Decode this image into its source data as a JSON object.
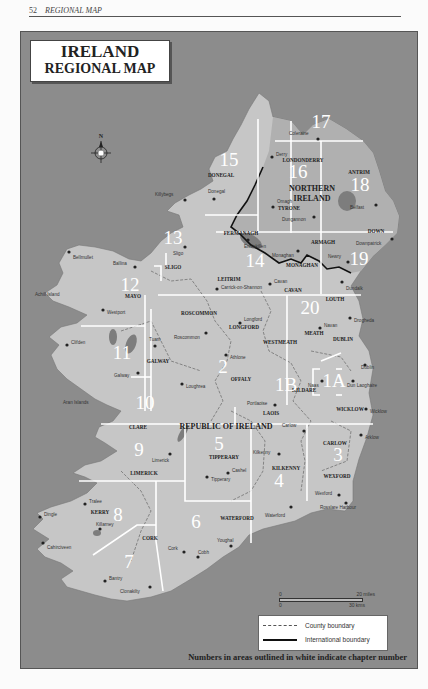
{
  "page_header": {
    "page_number": "52",
    "section": "REGIONAL MAP"
  },
  "map": {
    "title_line1": "IRELAND",
    "title_line2": "REGIONAL MAP",
    "compass_label": "N",
    "regions": [
      {
        "chapter": "1A",
        "x": 333,
        "y": 386
      },
      {
        "chapter": "1B",
        "x": 285,
        "y": 390
      },
      {
        "chapter": "2",
        "x": 222,
        "y": 372
      },
      {
        "chapter": "3",
        "x": 337,
        "y": 460
      },
      {
        "chapter": "4",
        "x": 278,
        "y": 486
      },
      {
        "chapter": "5",
        "x": 218,
        "y": 449
      },
      {
        "chapter": "6",
        "x": 195,
        "y": 527
      },
      {
        "chapter": "7",
        "x": 128,
        "y": 567
      },
      {
        "chapter": "8",
        "x": 117,
        "y": 520
      },
      {
        "chapter": "9",
        "x": 138,
        "y": 455
      },
      {
        "chapter": "10",
        "x": 144,
        "y": 408
      },
      {
        "chapter": "11",
        "x": 121,
        "y": 358
      },
      {
        "chapter": "12",
        "x": 129,
        "y": 290
      },
      {
        "chapter": "13",
        "x": 172,
        "y": 243
      },
      {
        "chapter": "14",
        "x": 254,
        "y": 266
      },
      {
        "chapter": "15",
        "x": 228,
        "y": 165
      },
      {
        "chapter": "16",
        "x": 297,
        "y": 177
      },
      {
        "chapter": "17",
        "x": 320,
        "y": 127
      },
      {
        "chapter": "18",
        "x": 359,
        "y": 190
      },
      {
        "chapter": "19",
        "x": 358,
        "y": 264
      },
      {
        "chapter": "20",
        "x": 309,
        "y": 313
      }
    ],
    "counties": [
      {
        "name": "DONEGAL",
        "x": 220,
        "y": 176
      },
      {
        "name": "LONDONDERRY",
        "x": 302,
        "y": 161
      },
      {
        "name": "ANTRIM",
        "x": 358,
        "y": 173
      },
      {
        "name": "TYRONE",
        "x": 288,
        "y": 209
      },
      {
        "name": "FERMANAGH",
        "x": 240,
        "y": 234
      },
      {
        "name": "ARMAGH",
        "x": 322,
        "y": 243
      },
      {
        "name": "DOWN",
        "x": 375,
        "y": 232
      },
      {
        "name": "MONAGHAN",
        "x": 301,
        "y": 266
      },
      {
        "name": "SLIGO",
        "x": 172,
        "y": 268
      },
      {
        "name": "LEITRIM",
        "x": 228,
        "y": 280
      },
      {
        "name": "CAVAN",
        "x": 292,
        "y": 291
      },
      {
        "name": "MAYO",
        "x": 132,
        "y": 297
      },
      {
        "name": "ROSCOMMON",
        "x": 198,
        "y": 314
      },
      {
        "name": "LOUTH",
        "x": 334,
        "y": 300
      },
      {
        "name": "LONGFORD",
        "x": 243,
        "y": 328
      },
      {
        "name": "MEATH",
        "x": 313,
        "y": 334
      },
      {
        "name": "WESTMEATH",
        "x": 279,
        "y": 343
      },
      {
        "name": "DUBLIN",
        "x": 342,
        "y": 340
      },
      {
        "name": "GALWAY",
        "x": 157,
        "y": 362
      },
      {
        "name": "OFFALY",
        "x": 240,
        "y": 380
      },
      {
        "name": "KILDARE",
        "x": 303,
        "y": 391
      },
      {
        "name": "LAOIS",
        "x": 270,
        "y": 414
      },
      {
        "name": "WICKLOW",
        "x": 349,
        "y": 410
      },
      {
        "name": "CLARE",
        "x": 137,
        "y": 428
      },
      {
        "name": "CARLOW",
        "x": 334,
        "y": 444
      },
      {
        "name": "TIPPERARY",
        "x": 223,
        "y": 458
      },
      {
        "name": "KILKENNY",
        "x": 285,
        "y": 469
      },
      {
        "name": "WEXFORD",
        "x": 336,
        "y": 477
      },
      {
        "name": "LIMERICK",
        "x": 143,
        "y": 474
      },
      {
        "name": "KERRY",
        "x": 99,
        "y": 513
      },
      {
        "name": "CORK",
        "x": 149,
        "y": 539
      },
      {
        "name": "WATERFORD",
        "x": 236,
        "y": 519
      }
    ],
    "country_labels": [
      {
        "name": "NORTHERN",
        "x": 311,
        "y": 190
      },
      {
        "name": "IRELAND",
        "x": 311,
        "y": 200
      },
      {
        "name": "REPUBLIC OF IRELAND",
        "x": 225,
        "y": 428
      }
    ],
    "towns": [
      {
        "name": "Coleraine",
        "x": 317,
        "y": 138,
        "dx": -29,
        "dy": -6
      },
      {
        "name": "Derry",
        "x": 271,
        "y": 156,
        "dx": 4,
        "dy": -3
      },
      {
        "name": "Killybegs",
        "x": 184,
        "y": 199,
        "dx": -30,
        "dy": -6
      },
      {
        "name": "Donegal",
        "x": 213,
        "y": 198,
        "dx": -6,
        "dy": -8
      },
      {
        "name": "Omagh",
        "x": 272,
        "y": 206,
        "dx": 4,
        "dy": -6
      },
      {
        "name": "Dungannon",
        "x": 313,
        "y": 216,
        "dx": -32,
        "dy": 2
      },
      {
        "name": "Belfast",
        "x": 375,
        "y": 204,
        "dx": -26,
        "dy": 2
      },
      {
        "name": "Enniskillen",
        "x": 247,
        "y": 239,
        "dx": -4,
        "dy": 6
      },
      {
        "name": "Downpatrick",
        "x": 391,
        "y": 238,
        "dx": -36,
        "dy": 4
      },
      {
        "name": "Monaghan",
        "x": 297,
        "y": 250,
        "dx": -26,
        "dy": 4
      },
      {
        "name": "Newry",
        "x": 347,
        "y": 261,
        "dx": -20,
        "dy": -6
      },
      {
        "name": "Sligo",
        "x": 184,
        "y": 246,
        "dx": -12,
        "dy": 6
      },
      {
        "name": "Bellmullet",
        "x": 68,
        "y": 251,
        "dx": 4,
        "dy": 5
      },
      {
        "name": "Ballina",
        "x": 134,
        "y": 266,
        "dx": -22,
        "dy": -4
      },
      {
        "name": "Carrick-on-Shannon",
        "x": 216,
        "y": 288,
        "dx": 4,
        "dy": -2
      },
      {
        "name": "Cavan",
        "x": 269,
        "y": 283,
        "dx": 4,
        "dy": -3
      },
      {
        "name": "Dundalk",
        "x": 341,
        "y": 281,
        "dx": 4,
        "dy": 6
      },
      {
        "name": "Westport",
        "x": 102,
        "y": 309,
        "dx": 4,
        "dy": 2
      },
      {
        "name": "Achill Island",
        "x": 34,
        "y": 293,
        "dx": 0,
        "dy": 0
      },
      {
        "name": "Longford",
        "x": 239,
        "y": 322,
        "dx": 4,
        "dy": -4
      },
      {
        "name": "Roscommon",
        "x": 205,
        "y": 332,
        "dx": -32,
        "dy": 4
      },
      {
        "name": "Drogheda",
        "x": 349,
        "y": 317,
        "dx": 4,
        "dy": 2
      },
      {
        "name": "Navan",
        "x": 319,
        "y": 327,
        "dx": 4,
        "dy": -3
      },
      {
        "name": "Clifden",
        "x": 66,
        "y": 344,
        "dx": 4,
        "dy": -3
      },
      {
        "name": "Tuam",
        "x": 154,
        "y": 345,
        "dx": -6,
        "dy": -7
      },
      {
        "name": "Athlone",
        "x": 225,
        "y": 354,
        "dx": 4,
        "dy": 2
      },
      {
        "name": "Galway",
        "x": 137,
        "y": 372,
        "dx": -24,
        "dy": 2
      },
      {
        "name": "Loughrea",
        "x": 181,
        "y": 383,
        "dx": 4,
        "dy": 2
      },
      {
        "name": "Dublin",
        "x": 364,
        "y": 364,
        "dx": -4,
        "dy": 2
      },
      {
        "name": "Naas",
        "x": 321,
        "y": 380,
        "dx": -14,
        "dy": 4
      },
      {
        "name": "Dun Laoghaire",
        "x": 352,
        "y": 380,
        "dx": -6,
        "dy": 4
      },
      {
        "name": "Aran Islands",
        "x": 62,
        "y": 401,
        "dx": 0,
        "dy": 0
      },
      {
        "name": "Portlaoise",
        "x": 274,
        "y": 404,
        "dx": -28,
        "dy": -2
      },
      {
        "name": "Wicklow",
        "x": 365,
        "y": 408,
        "dx": 4,
        "dy": 2
      },
      {
        "name": "Carlow",
        "x": 303,
        "y": 430,
        "dx": -22,
        "dy": -6
      },
      {
        "name": "Arklow",
        "x": 360,
        "y": 434,
        "dx": 4,
        "dy": 2
      },
      {
        "name": "Limerick",
        "x": 169,
        "y": 453,
        "dx": -18,
        "dy": 6
      },
      {
        "name": "Kilkenny",
        "x": 278,
        "y": 453,
        "dx": -26,
        "dy": -2
      },
      {
        "name": "Cashel",
        "x": 227,
        "y": 472,
        "dx": 4,
        "dy": -3
      },
      {
        "name": "Tipperary",
        "x": 206,
        "y": 476,
        "dx": 4,
        "dy": 2
      },
      {
        "name": "Wexford",
        "x": 338,
        "y": 494,
        "dx": -24,
        "dy": -2
      },
      {
        "name": "Rosslare Harbour",
        "x": 345,
        "y": 502,
        "dx": -26,
        "dy": 4
      },
      {
        "name": "Tralee",
        "x": 84,
        "y": 503,
        "dx": 4,
        "dy": -3
      },
      {
        "name": "Dingle",
        "x": 39,
        "y": 516,
        "dx": 4,
        "dy": -3
      },
      {
        "name": "Killarney",
        "x": 99,
        "y": 528,
        "dx": -4,
        "dy": -5
      },
      {
        "name": "Waterford",
        "x": 290,
        "y": 506,
        "dx": -26,
        "dy": 8
      },
      {
        "name": "Cahirciveen",
        "x": 42,
        "y": 542,
        "dx": 4,
        "dy": 4
      },
      {
        "name": "Youghal",
        "x": 230,
        "y": 545,
        "dx": -14,
        "dy": -6
      },
      {
        "name": "Cork",
        "x": 183,
        "y": 551,
        "dx": -16,
        "dy": -4
      },
      {
        "name": "Cobh",
        "x": 197,
        "y": 556,
        "dx": 0,
        "dy": -5
      },
      {
        "name": "Bantry",
        "x": 104,
        "y": 580,
        "dx": 4,
        "dy": -3
      },
      {
        "name": "Clonakilty",
        "x": 149,
        "y": 586,
        "dx": -30,
        "dy": 4
      }
    ]
  },
  "scale_bar": {
    "miles_start": "0",
    "miles_end": "20 miles",
    "km_start": "0",
    "km_end": "30 kms"
  },
  "legend": {
    "items": [
      {
        "label": "County boundary",
        "style": "county"
      },
      {
        "label": "International boundary",
        "style": "international"
      }
    ]
  },
  "footnote": "Numbers in areas outlined in white indicate chapter number",
  "colors": {
    "sea": "#8c8c8c",
    "land_republic": "#c6c6c6",
    "land_northern": "#b0b0b0",
    "lakes": "#7d7d7d",
    "chapter_outline": "#ffffff",
    "text_dark": "#222222"
  }
}
